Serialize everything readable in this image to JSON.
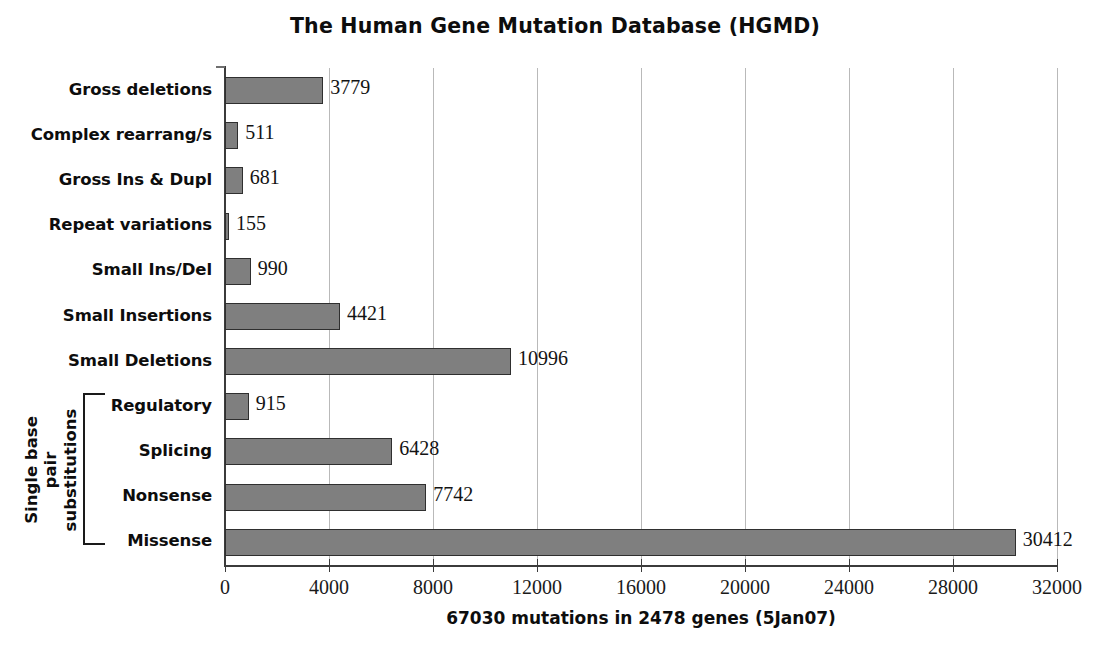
{
  "chart_data": {
    "type": "bar",
    "orientation": "horizontal",
    "title": "The Human Gene Mutation Database (HGMD)",
    "xlabel": "67030 mutations in 2478 genes (5Jan07)",
    "ylabel": "",
    "xlim": [
      0,
      32000
    ],
    "xticks": [
      "0",
      "4000",
      "8000",
      "12000",
      "16000",
      "20000",
      "24000",
      "28000",
      "32000"
    ],
    "xtick_values": [
      0,
      4000,
      8000,
      12000,
      16000,
      20000,
      24000,
      28000,
      32000
    ],
    "grid": "vertical",
    "legend": "none",
    "bar_color": "#7f7f7f",
    "bar_border_color": "#2f2f2f",
    "categories": [
      "Gross deletions",
      "Complex rearrang/s",
      "Gross Ins & Dupl",
      "Repeat variations",
      "Small Ins/Del",
      "Small Insertions",
      "Small Deletions",
      "Regulatory",
      "Splicing",
      "Nonsense",
      "Missense"
    ],
    "values": [
      3779,
      511,
      681,
      155,
      990,
      4421,
      10996,
      915,
      6428,
      7742,
      30412
    ],
    "value_labels": [
      "3779",
      "511",
      "681",
      "155",
      "990",
      "4421",
      "10996",
      "915",
      "6428",
      "7742",
      "30412"
    ],
    "annotations": [
      {
        "text": "Single base pair substitutions",
        "text_lines": [
          "Single base pair",
          "substitutions"
        ],
        "type": "group-bracket",
        "covers": [
          "Regulatory",
          "Splicing",
          "Nonsense",
          "Missense"
        ]
      }
    ]
  }
}
